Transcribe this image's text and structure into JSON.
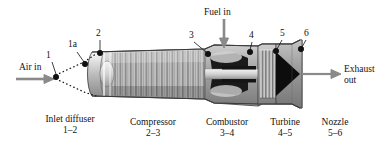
{
  "figure": {
    "type": "engine-cutaway-diagram",
    "background": "#ffffff",
    "ink": "#111111",
    "arrow_color": "#808080"
  },
  "flow_labels": {
    "air_in": "Air in",
    "fuel_in": "Fuel in",
    "exhaust_line1": "Exhaust",
    "exhaust_line2": "out"
  },
  "stations": [
    {
      "id": "1",
      "label": "1"
    },
    {
      "id": "1a",
      "label": "1a"
    },
    {
      "id": "2",
      "label": "2"
    },
    {
      "id": "3",
      "label": "3"
    },
    {
      "id": "4",
      "label": "4"
    },
    {
      "id": "5",
      "label": "5"
    },
    {
      "id": "6",
      "label": "6"
    }
  ],
  "components": [
    {
      "name": "Inlet diffuser",
      "range": "1–2"
    },
    {
      "name": "Compressor",
      "range": "2–3"
    },
    {
      "name": "Combustor",
      "range": "3–4"
    },
    {
      "name": "Turbine",
      "range": "4–5"
    },
    {
      "name": "Nozzle",
      "range": "5–6"
    }
  ]
}
